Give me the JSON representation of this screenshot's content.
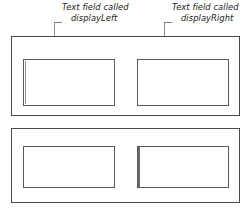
{
  "figure": {
    "annotations": [
      {
        "id": "display-left",
        "line1": "Text field called",
        "line2": "displayLeft"
      },
      {
        "id": "display-right",
        "line1": "Text field called",
        "line2": "displayRight"
      }
    ],
    "panels": [
      {
        "id": "panel-top",
        "fields": [
          {
            "id": "display-left",
            "value": ""
          },
          {
            "id": "display-right",
            "value": ""
          }
        ]
      },
      {
        "id": "panel-bottom",
        "fields": [
          {
            "id": "bottom-left",
            "value": ""
          },
          {
            "id": "bottom-right",
            "value": ""
          }
        ]
      }
    ],
    "colors": {
      "panel_border": "#4a4a4a",
      "field_border": "#5a5a5a",
      "leader_line": "#8c8c8c",
      "text": "#1d1d1d",
      "background": "#ffffff"
    }
  }
}
